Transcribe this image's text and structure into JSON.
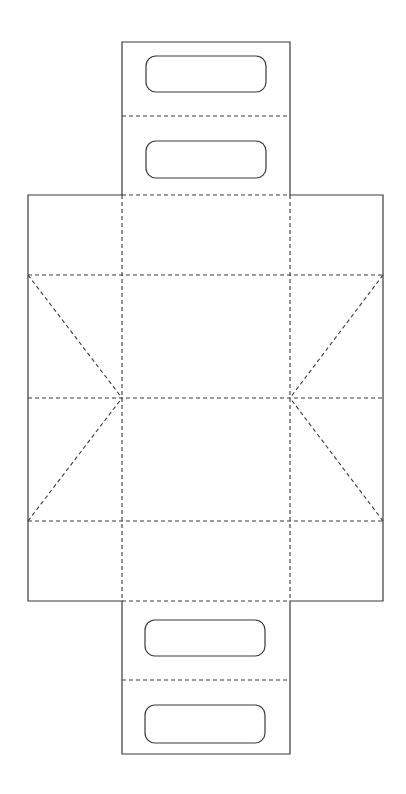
{
  "diagram": {
    "type": "box-dieline-template",
    "colors": {
      "background": "#ffffff",
      "line": "#3a3a3a"
    },
    "line_types": {
      "cut": "solid",
      "fold": "dashed"
    },
    "panels": [
      "top-flap-outer",
      "top-flap-inner",
      "back-panel",
      "base-panel",
      "front-panel",
      "bottom-flap-inner",
      "bottom-flap-outer",
      "left-side-panel",
      "right-side-panel"
    ],
    "handle_cutouts": 4,
    "diagonal_gusset_folds": 4
  }
}
